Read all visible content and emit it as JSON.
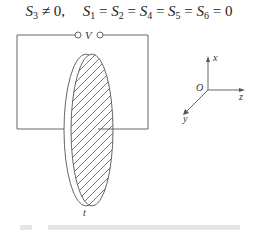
{
  "equation": {
    "nonzero_term": {
      "symbol": "S",
      "sub": "3",
      "relation": "≠",
      "value": "0"
    },
    "separator": ",",
    "zero_terms": [
      {
        "symbol": "S",
        "sub": "1"
      },
      {
        "symbol": "S",
        "sub": "2"
      },
      {
        "symbol": "S",
        "sub": "4"
      },
      {
        "symbol": "S",
        "sub": "5"
      },
      {
        "symbol": "S",
        "sub": "6"
      }
    ],
    "equals": "=",
    "zero_value": "0"
  },
  "circuit": {
    "voltage_label": "V",
    "thickness_label": "t",
    "terminal_icon": "open-circle-terminal",
    "line_color": "#555555",
    "hatch_color": "#555555"
  },
  "axes": {
    "origin_label": "O",
    "x_label": "x",
    "y_label": "y",
    "z_label": "z",
    "axis_color": "#555555"
  },
  "caption": {
    "visible": "faint, cut off at bottom edge (illegible)"
  }
}
